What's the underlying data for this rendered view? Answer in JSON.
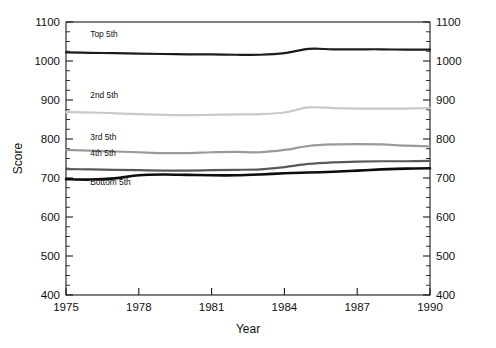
{
  "chart_data": {
    "type": "line",
    "title": "",
    "xlabel": "Year",
    "ylabel": "Score",
    "xlim": [
      1975,
      1990
    ],
    "ylim": [
      400,
      1100
    ],
    "xticks": [
      1975,
      1978,
      1981,
      1984,
      1987,
      1990
    ],
    "yticks": [
      400,
      500,
      600,
      700,
      800,
      900,
      1000,
      1100
    ],
    "yticks_right": [
      400,
      500,
      600,
      700,
      800,
      900,
      1000,
      1100
    ],
    "minor_tick_step": 25,
    "grid": false,
    "legend": "inline-labels",
    "x": [
      1975,
      1976,
      1977,
      1978,
      1979,
      1980,
      1981,
      1982,
      1983,
      1984,
      1985,
      1986,
      1987,
      1988,
      1989,
      1990
    ],
    "series": [
      {
        "name": "Top 5th",
        "color": "#1c1c1c",
        "width": 2.2,
        "label_x": 1976.0,
        "label_y": 1062,
        "values": [
          1022,
          1021,
          1020,
          1019,
          1018,
          1017,
          1017,
          1016,
          1016,
          1020,
          1031,
          1030,
          1030,
          1030,
          1029,
          1029
        ]
      },
      {
        "name": "2nd 5th",
        "color": "#c9c9c9",
        "width": 2.2,
        "label_x": 1976.0,
        "label_y": 904,
        "values": [
          869,
          868,
          866,
          864,
          862,
          861,
          862,
          863,
          864,
          868,
          881,
          879,
          878,
          878,
          878,
          879
        ]
      },
      {
        "name": "3rd 5th",
        "color": "#9a9a9a",
        "width": 2.2,
        "label_x": 1976.0,
        "label_y": 797,
        "values": [
          772,
          770,
          768,
          766,
          764,
          764,
          766,
          767,
          766,
          772,
          782,
          786,
          787,
          786,
          783,
          781
        ]
      },
      {
        "name": "4th 5th",
        "color": "#595959",
        "width": 2.2,
        "label_x": 1976.0,
        "label_y": 757,
        "values": [
          723,
          722,
          721,
          720,
          719,
          719,
          720,
          721,
          722,
          728,
          736,
          740,
          742,
          743,
          743,
          744
        ]
      },
      {
        "name": "Bottom 5th",
        "color": "#0d0d0d",
        "width": 2.6,
        "label_x": 1976.0,
        "label_y": 683,
        "values": [
          697,
          696,
          699,
          707,
          709,
          708,
          707,
          707,
          709,
          712,
          714,
          716,
          719,
          722,
          724,
          725
        ]
      }
    ]
  }
}
